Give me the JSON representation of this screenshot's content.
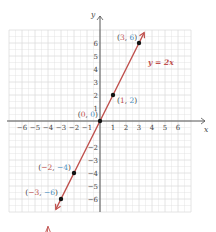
{
  "chart_data": {
    "type": "line",
    "title": "",
    "xlabel": "x",
    "ylabel": "y",
    "xlim": [
      -7,
      7
    ],
    "ylim": [
      -7,
      7
    ],
    "grid": true,
    "x_ticks": [
      -6,
      -5,
      -4,
      -3,
      -2,
      -1,
      1,
      2,
      3,
      4,
      5,
      6
    ],
    "y_ticks": [
      -6,
      -5,
      -4,
      -3,
      -2,
      1,
      2,
      3,
      4,
      5,
      6
    ],
    "x_tick_labels": [
      "−6",
      "−5",
      "−4",
      "−3",
      "−2",
      "−1",
      "1",
      "2",
      "3",
      "4",
      "5",
      "6"
    ],
    "y_tick_labels": [
      "−6",
      "−5",
      "−4",
      "−3",
      "−2",
      "1",
      "2",
      "3",
      "4",
      "5",
      "6"
    ],
    "series": [
      {
        "name": "y = 2x",
        "equation": "y = 2x",
        "color": "#c0504d",
        "x": [
          -3.4,
          3.4
        ],
        "y": [
          -6.8,
          6.8
        ]
      }
    ],
    "points": [
      {
        "x": 3,
        "y": 6,
        "label": "(3, 6)"
      },
      {
        "x": 1,
        "y": 2,
        "label": "(1, 2)"
      },
      {
        "x": 0,
        "y": 0,
        "label": "(0, 0)"
      },
      {
        "x": -2,
        "y": -4,
        "label": "(−2, −4)"
      },
      {
        "x": -3,
        "y": -6,
        "label": "(−3, −6)"
      }
    ],
    "annotations": [
      "y = 2x"
    ]
  },
  "colors": {
    "line": "#c0504d",
    "x_coord": "#c0504d",
    "y_coord": "#4a90c2",
    "grid": "#dddddd",
    "axis": "#555555"
  }
}
